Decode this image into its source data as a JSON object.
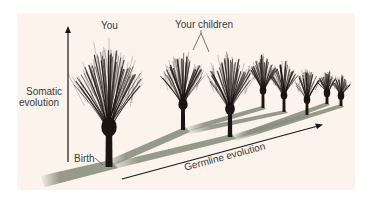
{
  "labels": {
    "you": "You",
    "children": "Your children",
    "somatic_line1": "Somatic",
    "somatic_line2": "evolution",
    "birth": "Birth",
    "germline": "Germline evolution"
  },
  "colors": {
    "background": "#fbf3ec",
    "tree": "#1a1512",
    "shadow": "#8a9080",
    "arrow": "#1a1a1a",
    "text": "#3a3a3a"
  },
  "trees": [
    {
      "name": "you",
      "x": 109,
      "base": 167,
      "height": 125,
      "width": 70
    },
    {
      "name": "child-1",
      "x": 183,
      "base": 130,
      "height": 80,
      "width": 42
    },
    {
      "name": "child-2",
      "x": 230,
      "base": 137,
      "height": 88,
      "width": 44
    },
    {
      "name": "grandchild-1",
      "x": 263,
      "base": 108,
      "height": 55,
      "width": 26
    },
    {
      "name": "grandchild-2",
      "x": 284,
      "base": 112,
      "height": 52,
      "width": 26
    },
    {
      "name": "grandchild-3",
      "x": 307,
      "base": 115,
      "height": 48,
      "width": 24
    },
    {
      "name": "grandchild-4",
      "x": 327,
      "base": 104,
      "height": 34,
      "width": 16
    },
    {
      "name": "grandchild-5",
      "x": 341,
      "base": 106,
      "height": 32,
      "width": 16
    }
  ]
}
